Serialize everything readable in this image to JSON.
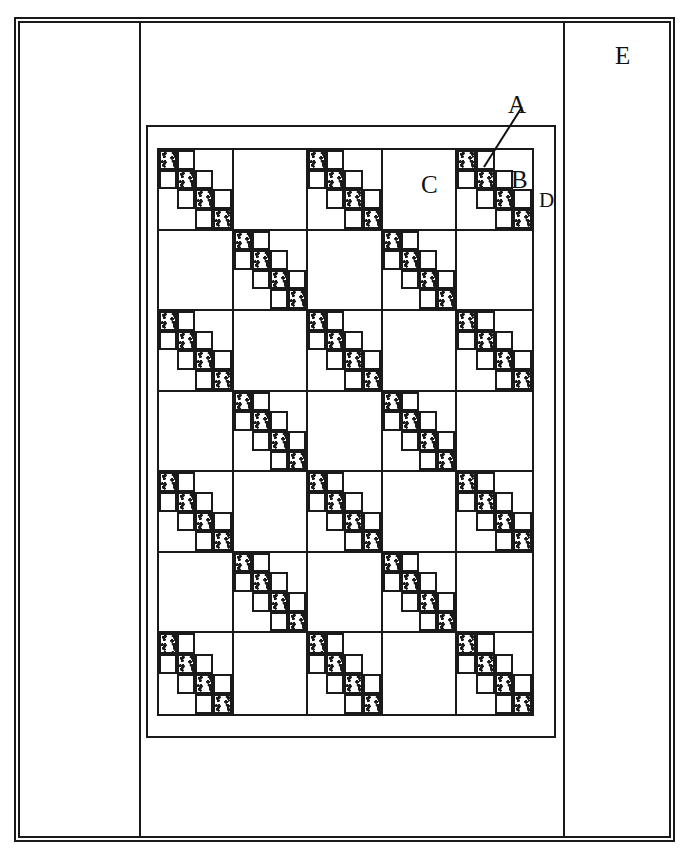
{
  "figure": {
    "type": "line-drawing",
    "background_color": "#ffffff",
    "line_color": "#1a1a1a",
    "width": 695,
    "height": 865
  },
  "labels": [
    {
      "key": "A",
      "text": "A",
      "meaning": "plain-square-patch",
      "has_leader_line": true
    },
    {
      "key": "B",
      "text": "B",
      "meaning": "block",
      "has_leader_line": false
    },
    {
      "key": "C",
      "text": "C",
      "meaning": "alternate-plain-block",
      "has_leader_line": false
    },
    {
      "key": "D",
      "text": "D",
      "meaning": "inner-border",
      "has_leader_line": false
    },
    {
      "key": "E",
      "text": "E",
      "meaning": "outer-border",
      "has_leader_line": false
    }
  ],
  "label_a": "A",
  "label_b": "B",
  "label_c": "C",
  "label_d": "D",
  "label_e": "E",
  "quilt": {
    "rows": 7,
    "columns": 5,
    "block_order": [
      [
        "chain",
        "plain",
        "chain",
        "plain",
        "chain"
      ],
      [
        "plain",
        "chain",
        "plain",
        "chain",
        "plain"
      ],
      [
        "chain",
        "plain",
        "chain",
        "plain",
        "chain"
      ],
      [
        "plain",
        "chain",
        "plain",
        "chain",
        "plain"
      ],
      [
        "chain",
        "plain",
        "chain",
        "plain",
        "chain"
      ],
      [
        "plain",
        "chain",
        "plain",
        "chain",
        "plain"
      ],
      [
        "chain",
        "plain",
        "chain",
        "plain",
        "chain"
      ]
    ],
    "chain_block": {
      "grid": 4,
      "print_cells": [
        [
          0,
          0
        ],
        [
          1,
          1
        ],
        [
          2,
          2
        ],
        [
          3,
          3
        ]
      ],
      "plain_outlined_cells": [
        [
          0,
          1
        ],
        [
          1,
          0
        ],
        [
          1,
          2
        ],
        [
          2,
          1
        ],
        [
          2,
          3
        ],
        [
          3,
          2
        ]
      ]
    }
  },
  "borders": {
    "inner_border_label": "D",
    "outer_border_label": "E"
  }
}
